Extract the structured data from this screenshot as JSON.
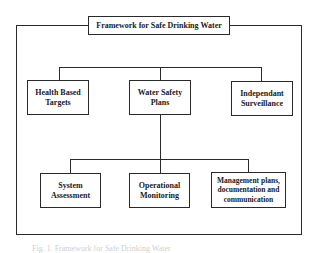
{
  "diagram": {
    "title": "Framework for Safe Drinking Water",
    "level1": [
      {
        "label": "Health Based Targets"
      },
      {
        "label": "Water Safety Plans"
      },
      {
        "label": "Independant Surveillance"
      }
    ],
    "level2": [
      {
        "label": "System Assessment"
      },
      {
        "label": "Operational Monitoring"
      },
      {
        "label": "Management plans, documentation and communication"
      }
    ],
    "caption": "Fig. 1. Framework for Safe Drinking Water"
  }
}
